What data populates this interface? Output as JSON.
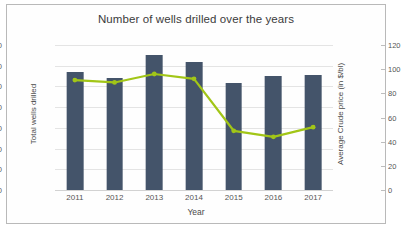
{
  "chart_data": {
    "type": "bar",
    "title": "Number of wells drilled over the years",
    "xlabel": "Year",
    "ylabel": "Total wells drilled",
    "y2label": "Average Crude price (in $/bl)",
    "categories": [
      "2011",
      "2012",
      "2013",
      "2014",
      "2015",
      "2016",
      "2017"
    ],
    "ylim": [
      0,
      700
    ],
    "yticks": [
      0,
      100,
      200,
      300,
      400,
      500,
      600,
      700
    ],
    "y2lim": [
      0,
      120
    ],
    "y2ticks": [
      0,
      20,
      40,
      60,
      80,
      100,
      120
    ],
    "grid": true,
    "legend": "none",
    "series": [
      {
        "name": "Total wells drilled",
        "type": "bar",
        "axis": "left",
        "color": "#44546a",
        "values": [
          570,
          540,
          650,
          620,
          515,
          550,
          557
        ]
      },
      {
        "name": "Average Crude price (in $/bl)",
        "type": "line",
        "axis": "right",
        "color": "#a2c617",
        "values": [
          91,
          89,
          96,
          92,
          49,
          44,
          52
        ]
      }
    ]
  },
  "colors": {
    "bar": "#44546a",
    "line": "#a2c617",
    "grid": "#e4e4e4",
    "border": "#b9b9b9",
    "text": "#4a4a4a"
  }
}
